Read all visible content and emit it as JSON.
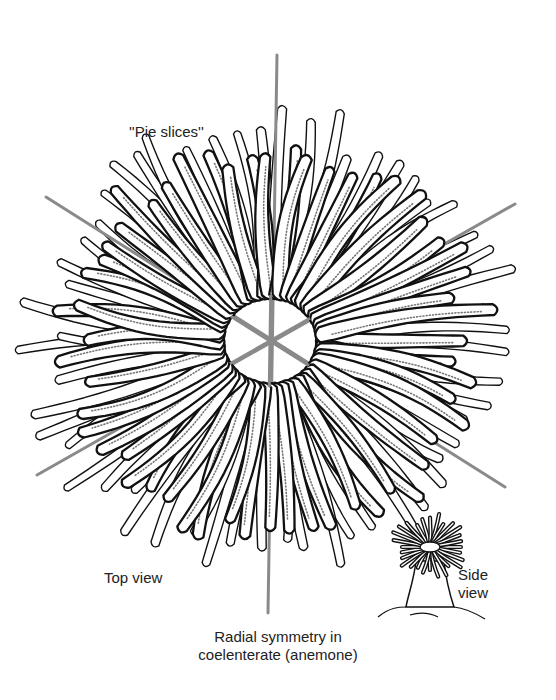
{
  "figure": {
    "title": "Radial symmetry in coelenterate (anemone)",
    "caption_lines": [
      "Radial symmetry in",
      "coelenterate (anemone)"
    ],
    "labels": {
      "pie_slices": "''Pie slices''",
      "top_view": "Top view",
      "side_view_lines": [
        "Side",
        "view"
      ]
    },
    "symmetry_axes": {
      "center": [
        270,
        341
      ],
      "color": "#8a8a8a",
      "lines": [
        {
          "name": "vertical",
          "from": [
            277,
            55
          ],
          "to": [
            268,
            613
          ]
        },
        {
          "name": "diagonal-down",
          "from": [
            46,
            197
          ],
          "to": [
            505,
            487
          ]
        },
        {
          "name": "diagonal-up",
          "from": [
            37,
            475
          ],
          "to": [
            515,
            204
          ]
        }
      ]
    },
    "anemone_top_view": {
      "center": [
        270,
        341
      ],
      "inner_radius_x": 50,
      "inner_radius_y": 46,
      "outer_radius_x": 225,
      "outer_radius_y": 200,
      "tentacle_count": 56,
      "stroke_color": "#111111",
      "stipple_color": "#777777"
    },
    "anemone_side_view": {
      "center": [
        430,
        555
      ],
      "tentacle_count": 28
    }
  }
}
